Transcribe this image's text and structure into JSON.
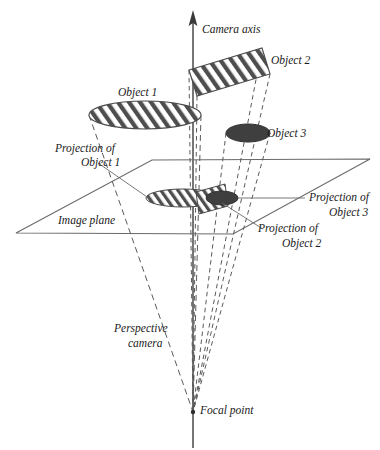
{
  "figure": {
    "background_color": "#ffffff",
    "ink_color": "#3a3a3a",
    "dark_fill_color": "#3f3f3f",
    "hatch_color": "#4a4a4a"
  },
  "labels": {
    "camera_axis": "Camera axis",
    "object1": "Object 1",
    "object2": "Object 2",
    "object3": "Object 3",
    "projection_of": "Projection of",
    "projection_object1_line1": "Projection of",
    "projection_object1_line2": "Object 1",
    "projection_object2_line1": "Projection of",
    "projection_object2_line2": "Object 2",
    "projection_object3_line1": "Projection of",
    "projection_object3_line2": "Object 3",
    "image_plane": "Image plane",
    "perspective_camera_line1": "Perspective",
    "perspective_camera_line2": "camera",
    "focal_point": "Focal point"
  },
  "geometry": {
    "camera_axis": {
      "x": 193,
      "y_top": 12,
      "y_bottom": 448,
      "arrow_tip_y": 12
    },
    "focal_point": {
      "x": 193,
      "y": 412
    },
    "image_plane": {
      "corners": [
        {
          "x": 16,
          "y": 233
        },
        {
          "x": 152,
          "y": 160
        },
        {
          "x": 370,
          "y": 159
        },
        {
          "x": 233,
          "y": 234
        }
      ]
    },
    "object1": {
      "type": "ellipse",
      "cx": 145,
      "cy": 115,
      "rx": 56,
      "ry": 14,
      "fill": "hatched"
    },
    "object2": {
      "type": "parallelogram",
      "points": [
        {
          "x": 189,
          "y": 70
        },
        {
          "x": 262,
          "y": 48
        },
        {
          "x": 270,
          "y": 74
        },
        {
          "x": 197,
          "y": 96
        }
      ],
      "fill": "hatched"
    },
    "object3": {
      "type": "ellipse",
      "cx": 248,
      "cy": 133,
      "rx": 22,
      "ry": 9,
      "fill": "solid-dark"
    },
    "projection_object1": {
      "type": "ellipse",
      "cx": 183,
      "cy": 198,
      "rx": 37,
      "ry": 9,
      "fill": "hatched"
    },
    "projection_object2": {
      "type": "parallelogram",
      "points": [
        {
          "x": 196,
          "y": 192
        },
        {
          "x": 225,
          "y": 184
        },
        {
          "x": 228,
          "y": 206
        },
        {
          "x": 199,
          "y": 214
        }
      ],
      "fill": "hatched"
    },
    "projection_object3": {
      "type": "ellipse",
      "cx": 222,
      "cy": 198,
      "rx": 16,
      "ry": 7,
      "fill": "solid-dark"
    }
  },
  "label_positions": {
    "camera_axis": {
      "x": 202,
      "y": 33
    },
    "object1": {
      "x": 141,
      "y": 96
    },
    "object2": {
      "x": 271,
      "y": 64
    },
    "object3": {
      "x": 267,
      "y": 137
    },
    "projection_object1": {
      "x": 56,
      "y": 155
    },
    "projection_object2": {
      "x": 270,
      "y": 233
    },
    "projection_object3": {
      "x": 311,
      "y": 201
    },
    "image_plane": {
      "x": 58,
      "y": 222
    },
    "perspective_camera": {
      "x": 118,
      "y": 331
    },
    "focal_point": {
      "x": 200,
      "y": 411
    }
  }
}
